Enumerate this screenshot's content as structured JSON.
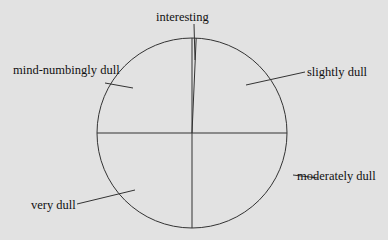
{
  "chart_data": {
    "type": "pie",
    "title": "",
    "categories": [
      "interesting",
      "slightly dull",
      "moderately dull",
      "very dull",
      "mind-numbingly dull"
    ],
    "values": [
      0.7,
      24.3,
      25,
      25,
      25
    ],
    "units": "percent",
    "start_angle_deg": 0,
    "direction": "clockwise",
    "fill": "none",
    "stroke_color": "#333333",
    "background": "#e2e2e2",
    "labels_with_leader_lines": true,
    "legend": "none"
  },
  "labels": {
    "interesting": "interesting",
    "slightly_dull": "slightly dull",
    "moderately_dull": "moderately dull",
    "very_dull": "very dull",
    "mind_numbingly_dull": "mind-numbingly dull"
  }
}
